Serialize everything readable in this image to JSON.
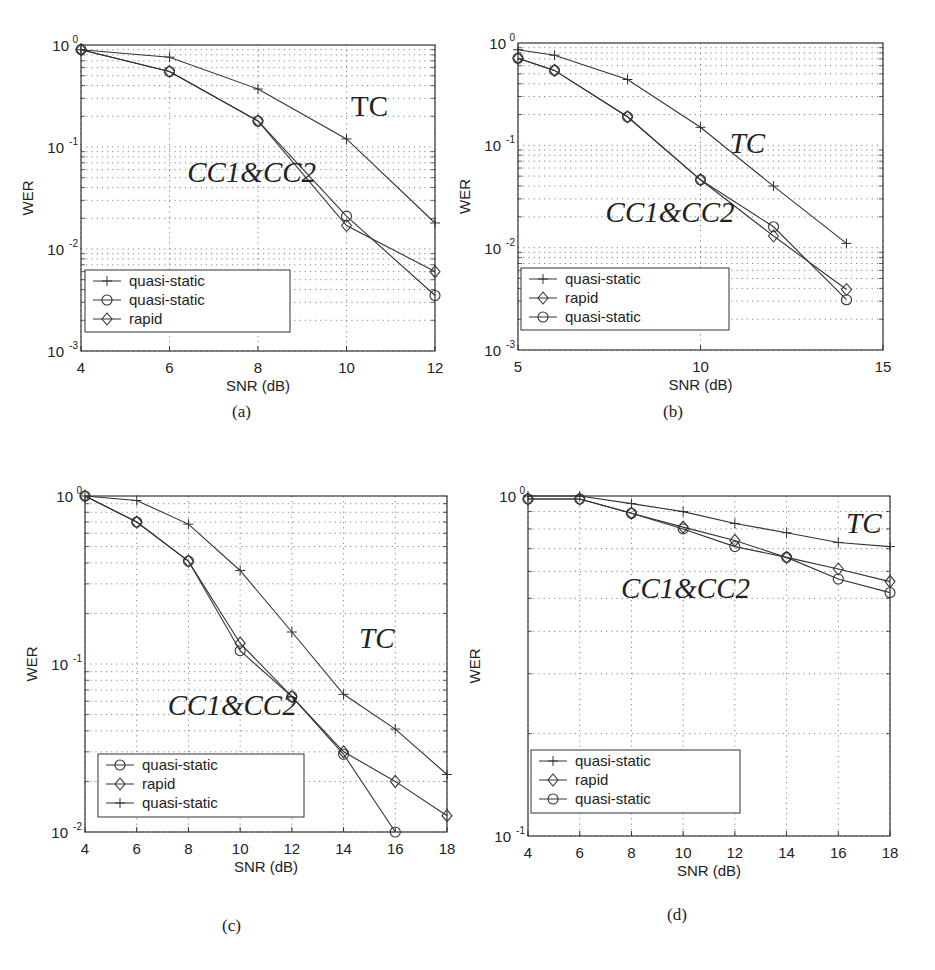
{
  "figure": {
    "captions": [
      "(a)",
      "(b)",
      "(c)",
      "(d)"
    ]
  },
  "chart_data": [
    {
      "id": "a",
      "type": "line",
      "caption": "(a)",
      "xlabel": "SNR (dB)",
      "ylabel": "WER",
      "yscale": "log",
      "xlim": [
        4,
        12
      ],
      "ylim": [
        0.001,
        1
      ],
      "xticks": [
        4,
        6,
        8,
        10,
        12
      ],
      "yticks": [
        "10^0",
        "10^-1",
        "10^-2",
        "10^-3"
      ],
      "grid": true,
      "legend_position": "lower left",
      "annotations": [
        {
          "text": "TC",
          "x": 10.1,
          "y": 0.2,
          "italic": false
        },
        {
          "text": "CC1&CC2",
          "x": 6.4,
          "y": 0.045,
          "italic": true
        }
      ],
      "legend": [
        "quasi-static",
        "quasi-static",
        "rapid"
      ],
      "series": [
        {
          "name": "quasi-static",
          "group": "TC",
          "marker": "plus",
          "x": [
            4,
            6,
            8,
            10,
            12
          ],
          "values": [
            0.9,
            0.76,
            0.37,
            0.12,
            0.018
          ]
        },
        {
          "name": "quasi-static",
          "group": "CC1&CC2",
          "marker": "circle",
          "x": [
            4,
            6,
            8,
            10,
            12
          ],
          "values": [
            0.9,
            0.55,
            0.18,
            0.021,
            0.0035
          ]
        },
        {
          "name": "rapid",
          "group": "CC1&CC2",
          "marker": "diamond",
          "x": [
            4,
            6,
            8,
            10,
            12
          ],
          "values": [
            0.9,
            0.55,
            0.18,
            0.017,
            0.006
          ]
        }
      ]
    },
    {
      "id": "b",
      "type": "line",
      "caption": "(b)",
      "xlabel": "SNR (dB)",
      "ylabel": "WER",
      "yscale": "log",
      "xlim": [
        5,
        15
      ],
      "ylim": [
        0.001,
        1
      ],
      "xticks": [
        5,
        10,
        15
      ],
      "yticks": [
        "10^0",
        "10^-1",
        "10^-2",
        "10^-3"
      ],
      "grid": true,
      "legend_position": "lower left",
      "annotations": [
        {
          "text": "TC",
          "x": 10.8,
          "y": 0.085,
          "italic": true
        },
        {
          "text": "CC1&CC2",
          "x": 7.4,
          "y": 0.018,
          "italic": true
        }
      ],
      "legend": [
        "quasi-static",
        "rapid",
        "quasi-static"
      ],
      "series": [
        {
          "name": "quasi-static",
          "group": "TC",
          "marker": "plus",
          "x": [
            5,
            6,
            8,
            10,
            12,
            14
          ],
          "values": [
            0.86,
            0.76,
            0.44,
            0.15,
            0.04,
            0.011
          ]
        },
        {
          "name": "rapid",
          "group": "CC1&CC2",
          "marker": "diamond",
          "x": [
            5,
            6,
            8,
            10,
            12,
            14
          ],
          "values": [
            0.71,
            0.54,
            0.19,
            0.046,
            0.013,
            0.0039
          ]
        },
        {
          "name": "quasi-static",
          "group": "CC1&CC2",
          "marker": "circle",
          "x": [
            5,
            6,
            8,
            10,
            12,
            14
          ],
          "values": [
            0.71,
            0.54,
            0.19,
            0.046,
            0.016,
            0.0031
          ]
        }
      ]
    },
    {
      "id": "c",
      "type": "line",
      "caption": "(c)",
      "xlabel": "SNR (dB)",
      "ylabel": "WER",
      "yscale": "log",
      "xlim": [
        4,
        18
      ],
      "ylim": [
        0.01,
        1
      ],
      "xticks": [
        4,
        6,
        8,
        10,
        12,
        14,
        16,
        18
      ],
      "yticks": [
        "10^0",
        "10^-1",
        "10^-2"
      ],
      "grid": true,
      "legend_position": "lower left",
      "annotations": [
        {
          "text": "TC",
          "x": 14.6,
          "y": 0.125,
          "italic": true
        },
        {
          "text": "CC1&CC2",
          "x": 7.2,
          "y": 0.05,
          "italic": true
        }
      ],
      "legend": [
        "quasi-static",
        "rapid",
        "quasi-static"
      ],
      "series": [
        {
          "name": "quasi-static",
          "group": "CC1&CC2",
          "marker": "circle",
          "x": [
            4,
            6,
            8,
            10,
            12,
            14,
            16
          ],
          "values": [
            1.0,
            0.7,
            0.41,
            0.12,
            0.064,
            0.029,
            0.01
          ]
        },
        {
          "name": "rapid",
          "group": "CC1&CC2",
          "marker": "diamond",
          "x": [
            4,
            6,
            8,
            10,
            12,
            14,
            16,
            18
          ],
          "values": [
            1.0,
            0.7,
            0.41,
            0.133,
            0.064,
            0.03,
            0.02,
            0.0125
          ]
        },
        {
          "name": "quasi-static",
          "group": "TC",
          "marker": "plus",
          "x": [
            4,
            6,
            8,
            10,
            12,
            14,
            16,
            18
          ],
          "values": [
            1.0,
            0.94,
            0.68,
            0.36,
            0.155,
            0.066,
            0.041,
            0.022
          ]
        }
      ]
    },
    {
      "id": "d",
      "type": "line",
      "caption": "(d)",
      "xlabel": "SNR (dB)",
      "ylabel": "WER",
      "yscale": "log",
      "xlim": [
        4,
        18
      ],
      "ylim": [
        0.1,
        1
      ],
      "xticks": [
        4,
        6,
        8,
        10,
        12,
        14,
        16,
        18
      ],
      "yticks": [
        "10^0",
        "10^-1"
      ],
      "grid": true,
      "legend_position": "lower left",
      "annotations": [
        {
          "text": "TC",
          "x": 16.3,
          "y": 0.78,
          "italic": true
        },
        {
          "text": "CC1&CC2",
          "x": 7.6,
          "y": 0.5,
          "italic": true
        }
      ],
      "legend": [
        "quasi-static",
        "rapid",
        "quasi-static"
      ],
      "series": [
        {
          "name": "quasi-static",
          "group": "TC",
          "marker": "plus",
          "x": [
            4,
            6,
            8,
            10,
            12,
            14,
            16,
            18
          ],
          "values": [
            1.0,
            1.0,
            0.95,
            0.9,
            0.83,
            0.78,
            0.73,
            0.71
          ]
        },
        {
          "name": "rapid",
          "group": "CC1&CC2",
          "marker": "diamond",
          "x": [
            4,
            6,
            8,
            10,
            12,
            14,
            16,
            18
          ],
          "values": [
            0.98,
            0.98,
            0.89,
            0.81,
            0.74,
            0.66,
            0.61,
            0.56
          ]
        },
        {
          "name": "quasi-static",
          "group": "CC1&CC2",
          "marker": "circle",
          "x": [
            4,
            6,
            8,
            10,
            12,
            14,
            16,
            18
          ],
          "values": [
            0.98,
            0.98,
            0.89,
            0.8,
            0.71,
            0.66,
            0.57,
            0.52
          ]
        }
      ]
    }
  ],
  "layout": {
    "panels": [
      {
        "left": 81,
        "top": 45,
        "width": 354,
        "height": 306,
        "legend": {
          "x": 85,
          "y": 270,
          "w": 205,
          "h": 62
        }
      },
      {
        "left": 518,
        "top": 43,
        "width": 365,
        "height": 307,
        "legend": {
          "x": 521,
          "y": 268,
          "w": 208,
          "h": 62
        }
      },
      {
        "left": 85,
        "top": 496,
        "width": 362,
        "height": 336,
        "legend": {
          "x": 98,
          "y": 754,
          "w": 206,
          "h": 63
        }
      },
      {
        "left": 528,
        "top": 496,
        "width": 362,
        "height": 340,
        "legend": {
          "x": 531,
          "y": 750,
          "w": 209,
          "h": 63
        }
      }
    ],
    "captions": [
      {
        "x": 232,
        "y": 402
      },
      {
        "x": 663,
        "y": 402
      },
      {
        "x": 222,
        "y": 916
      },
      {
        "x": 667,
        "y": 905
      }
    ]
  }
}
